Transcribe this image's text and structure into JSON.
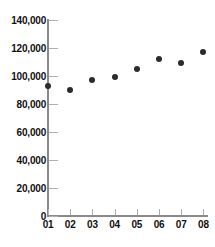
{
  "chart_data": {
    "type": "scatter",
    "title": "",
    "xlabel": "",
    "ylabel": "",
    "categories": [
      "01",
      "02",
      "03",
      "04",
      "05",
      "06",
      "07",
      "08"
    ],
    "values": [
      93000,
      90000,
      97000,
      99000,
      105000,
      112000,
      109000,
      117000
    ],
    "series": [
      {
        "name": "series-1",
        "values": [
          93000,
          90000,
          97000,
          99000,
          105000,
          112000,
          109000,
          117000
        ]
      }
    ],
    "ylim": [
      0,
      140000
    ],
    "yticks": [
      0,
      20000,
      40000,
      60000,
      80000,
      100000,
      120000,
      140000
    ],
    "ytick_labels": [
      "0",
      "20,000",
      "40,000",
      "60,000",
      "80,000",
      "100,000",
      "120,000",
      "140,000"
    ],
    "xtick_labels": [
      "01",
      "02",
      "03",
      "04",
      "05",
      "06",
      "07",
      "08"
    ],
    "grid": false,
    "legend": null,
    "marker_color": "#2b2b2b",
    "axis_color": "#8a8a8a",
    "tick_color": "#b0b0b0",
    "label_color": "#111111",
    "background": "#ffffff"
  }
}
